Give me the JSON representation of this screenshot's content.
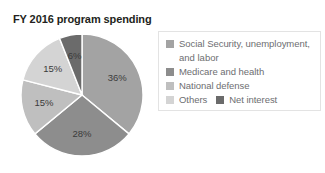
{
  "chart_data": {
    "type": "pie",
    "title": "FY 2016 program spending",
    "categories": [
      "Social Security, unemployment, and labor",
      "Medicare and health",
      "National defense",
      "Others",
      "Net interest"
    ],
    "values": [
      36,
      28,
      15,
      15,
      6
    ],
    "value_labels": [
      "36%",
      "28%",
      "15%",
      "15%",
      "6%"
    ],
    "colors": [
      "#a3a3a3",
      "#8d8d8d",
      "#bfbfbf",
      "#d4d4d4",
      "#6b6b6b"
    ],
    "legend_position": "right",
    "grid": false,
    "xlabel": "",
    "ylabel": ""
  },
  "legend": {
    "entries": [
      {
        "label": "Social Security, unemployment,",
        "continuation": "and labor",
        "color": "#a3a3a3"
      },
      {
        "label": "Medicare and health",
        "color": "#8d8d8d"
      },
      {
        "label": "National defense",
        "color": "#bfbfbf"
      },
      {
        "label": "Others",
        "color": "#d4d4d4"
      },
      {
        "label": "Net interest",
        "color": "#6b6b6b"
      }
    ]
  }
}
